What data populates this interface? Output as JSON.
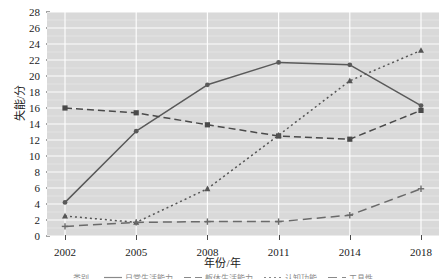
{
  "chart_data": {
    "type": "line",
    "title": "",
    "xlabel": "年份/年",
    "ylabel": "失能/分",
    "categories": [
      "2002",
      "2005",
      "2008",
      "2011",
      "2014",
      "2018"
    ],
    "ylim": [
      0,
      28
    ],
    "yticks": [
      0,
      2,
      4,
      6,
      8,
      10,
      12,
      14,
      16,
      18,
      20,
      22,
      24,
      26,
      28
    ],
    "grid": true,
    "legend_position": "bottom",
    "series": [
      {
        "name": "日常生活能力",
        "style": "solid",
        "marker": "circle",
        "color": "#5a5a5a",
        "values": [
          4.2,
          13.1,
          18.9,
          21.7,
          21.4,
          16.3
        ]
      },
      {
        "name": "躯体生活能力",
        "style": "dashed",
        "marker": "square",
        "color": "#4a4a4a",
        "values": [
          16.0,
          15.4,
          13.9,
          12.5,
          12.1,
          15.7
        ]
      },
      {
        "name": "认知功能",
        "style": "dotted",
        "marker": "triangle",
        "color": "#555555",
        "values": [
          2.5,
          1.7,
          5.9,
          12.6,
          19.4,
          23.2
        ]
      },
      {
        "name": "工具性",
        "style": "longdash",
        "marker": "plus",
        "color": "#6a6a6a",
        "values": [
          1.2,
          1.7,
          1.8,
          1.8,
          2.6,
          5.9
        ]
      }
    ]
  },
  "axes": {
    "y_tick_labels": [
      "0",
      "2",
      "4",
      "6",
      "8",
      "10",
      "12",
      "14",
      "16",
      "18",
      "20",
      "22",
      "24",
      "26",
      "28"
    ],
    "x_tick_labels": [
      "2002",
      "2005",
      "2008",
      "2011",
      "2014",
      "2018"
    ],
    "y_axis_title": "失能/分",
    "x_axis_title": "年份/年"
  },
  "legend": {
    "title": "类别",
    "items": [
      {
        "label": "日常生活能力",
        "style": "solid"
      },
      {
        "label": "躯体生活能力",
        "style": "dashed"
      },
      {
        "label": "认知功能",
        "style": "dotted"
      },
      {
        "label": "工具性",
        "style": "longdash"
      }
    ]
  },
  "colors": {
    "panel_background": "#d9d9d9",
    "gridline": "#ffffff",
    "text": "#1b1b1b",
    "line": "#4a4a4a"
  }
}
